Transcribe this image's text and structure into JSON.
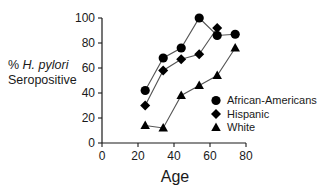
{
  "chart_data": {
    "type": "line",
    "title": "",
    "xlabel": "Age",
    "ylabel_line1": "% H. pylori",
    "ylabel_line1_plain": "% ",
    "ylabel_italic": "H. pylori",
    "ylabel_line2": "Seropositive",
    "xlim": [
      0,
      80
    ],
    "ylim": [
      0,
      100
    ],
    "xticks": [
      0,
      20,
      40,
      60,
      80
    ],
    "yticks": [
      0,
      20,
      40,
      60,
      80,
      100
    ],
    "xtick_labels": [
      "0",
      "20",
      "40",
      "60",
      "80"
    ],
    "ytick_labels": [
      "0",
      "20",
      "40",
      "60",
      "80",
      "100"
    ],
    "grid": false,
    "legend_position": "inside-bottom-right",
    "series": [
      {
        "name": "African-Americans",
        "marker": "circle",
        "color": "#000000",
        "x": [
          24,
          34,
          44,
          54,
          64,
          74
        ],
        "y": [
          42,
          68,
          76,
          100,
          86,
          87
        ]
      },
      {
        "name": "Hispanic",
        "marker": "diamond",
        "color": "#000000",
        "x": [
          24,
          34,
          44,
          54,
          64
        ],
        "y": [
          30,
          58,
          67,
          71,
          92
        ]
      },
      {
        "name": "White",
        "marker": "triangle",
        "color": "#000000",
        "x": [
          24,
          34,
          44,
          54,
          64,
          74
        ],
        "y": [
          14,
          12,
          38,
          46,
          54,
          76
        ]
      }
    ]
  },
  "legend": {
    "entries": [
      {
        "label": "African-Americans",
        "marker": "circle"
      },
      {
        "label": "Hispanic",
        "marker": "diamond"
      },
      {
        "label": "White",
        "marker": "triangle"
      }
    ]
  },
  "colors": {
    "marker": "#000000",
    "line": "#555555",
    "axis": "#1a1a1a",
    "background": "#ffffff"
  }
}
